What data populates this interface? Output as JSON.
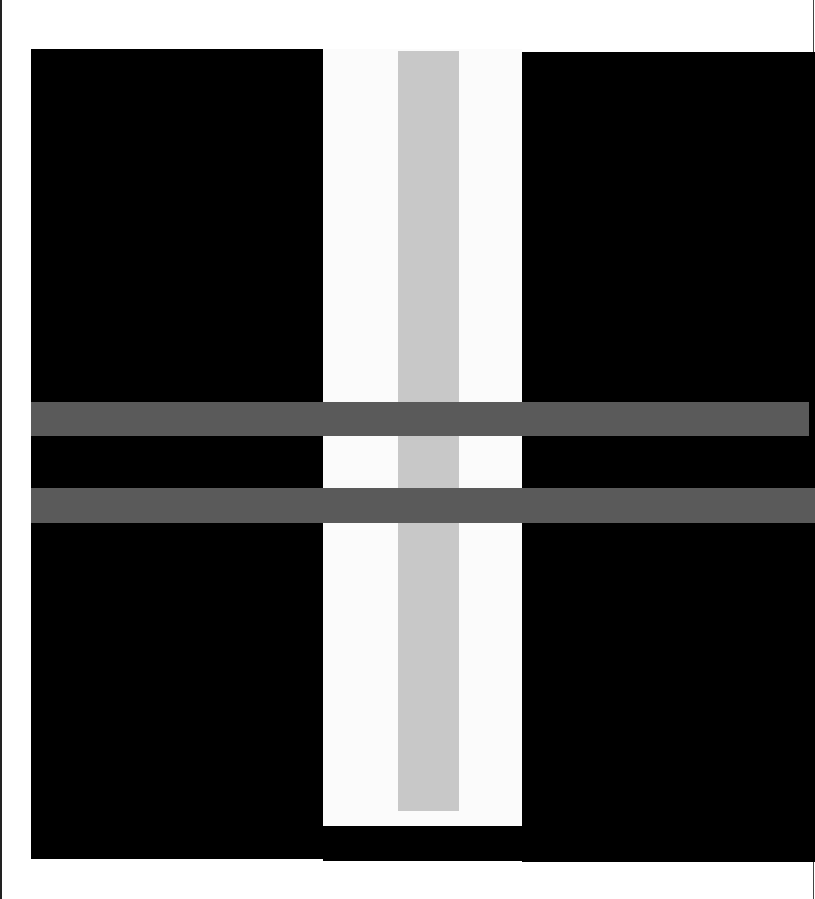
{
  "artwork": {
    "description": "Abstract geometric composition",
    "colors": {
      "background": "#ffffff",
      "black": "#000000",
      "white_strip": "#fbfbfb",
      "light_gray": "#c8c8c8",
      "dark_gray": "#5a5a5a",
      "edge_line": "#222222"
    },
    "shapes": [
      {
        "name": "black-left",
        "color": "black"
      },
      {
        "name": "black-right",
        "color": "black"
      },
      {
        "name": "white-strip",
        "color": "white_strip"
      },
      {
        "name": "gray-bar",
        "color": "light_gray"
      },
      {
        "name": "band-1",
        "color": "dark_gray"
      },
      {
        "name": "band-2",
        "color": "dark_gray"
      }
    ]
  }
}
